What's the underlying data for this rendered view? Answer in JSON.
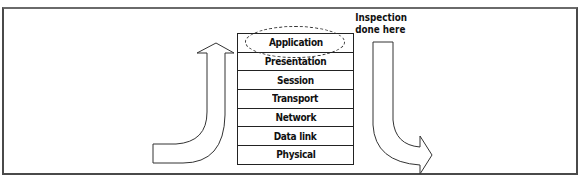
{
  "diagram": {
    "type": "osi-model-inspection",
    "layers": [
      {
        "name": "Application",
        "highlighted": true
      },
      {
        "name": "Presentation",
        "highlighted": false
      },
      {
        "name": "Session",
        "highlighted": false
      },
      {
        "name": "Transport",
        "highlighted": false
      },
      {
        "name": "Network",
        "highlighted": false
      },
      {
        "name": "Data link",
        "highlighted": false
      },
      {
        "name": "Physical",
        "highlighted": false
      }
    ],
    "annotation": {
      "line1": "Inspection",
      "line2": "done here"
    },
    "arrows": [
      {
        "name": "up-arrow",
        "direction": "up",
        "position": "left of stack"
      },
      {
        "name": "down-arrow",
        "direction": "down-then-right",
        "position": "right of stack"
      }
    ],
    "colors": {
      "line": "#222222",
      "frame": "#4a4a4a",
      "background": "#ffffff"
    }
  }
}
